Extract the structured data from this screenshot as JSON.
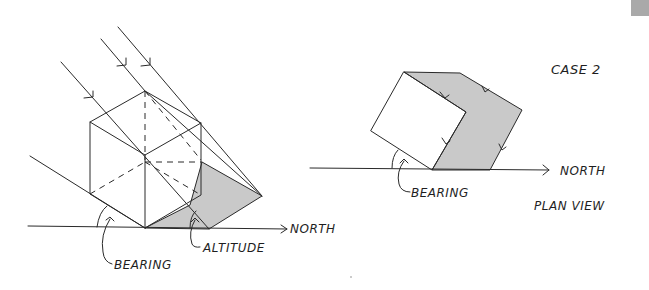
{
  "figure": {
    "case_label": "CASE 2",
    "left": {
      "north_label": "NORTH",
      "bearing_label": "BEARING",
      "altitude_label": "ALTITUDE"
    },
    "right": {
      "north_label": "NORTH",
      "bearing_label": "BEARING",
      "view_label": "PLAN VIEW"
    },
    "colors": {
      "ink": "#2a2a2a",
      "shadow": "#c9c9c9",
      "tab": "#a9a9a9"
    }
  }
}
